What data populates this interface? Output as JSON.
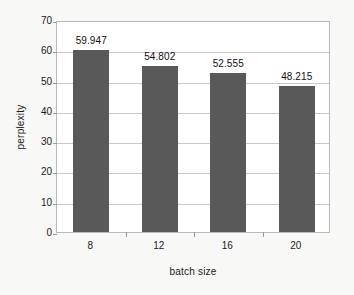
{
  "chart_data": {
    "type": "bar",
    "title": "",
    "xlabel": "batch size",
    "ylabel": "perplexity",
    "categories": [
      "8",
      "12",
      "16",
      "20"
    ],
    "values": [
      59.947,
      54.802,
      52.555,
      48.215
    ],
    "value_labels": [
      "59.947",
      "54.802",
      "52.555",
      "48.215"
    ],
    "ylim": [
      0,
      70
    ],
    "ytick_labels": [
      "0",
      "10",
      "20",
      "30",
      "40",
      "50",
      "60",
      "70"
    ],
    "ytick_values": [
      0,
      10,
      20,
      30,
      40,
      50,
      60,
      70
    ],
    "grid": "horizontal",
    "legend": "none",
    "series": [
      {
        "name": "perplexity",
        "values": [
          59.947,
          54.802,
          52.555,
          48.215
        ]
      }
    ]
  },
  "style": {
    "bar_color": "#595959",
    "gridline_color": "#c9c9c9",
    "frame_color": "#b9b9b9",
    "page_background": "#f8f8f6",
    "plot_background": "#ffffff",
    "text_color": "#1a1a1a"
  }
}
